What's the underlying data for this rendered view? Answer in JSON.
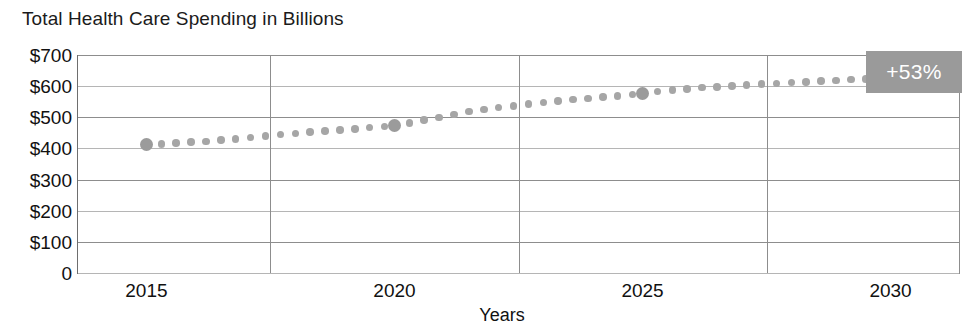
{
  "chart_data": {
    "type": "line",
    "title": "Total Health Care Spending in Billions",
    "xlabel": "Years",
    "ylabel": "",
    "xlim": [
      2013.6,
      2031.4
    ],
    "ylim": [
      0,
      700
    ],
    "grid": true,
    "legend": null,
    "marker_style": "dotted-line",
    "series_color": "#a6a6a6",
    "annotation": {
      "text": "+53%",
      "background": "#9a9a9a",
      "text_color": "#ffffff"
    },
    "y_ticks": [
      {
        "value": 700,
        "label": "$700"
      },
      {
        "value": 600,
        "label": "$600"
      },
      {
        "value": 500,
        "label": "$500"
      },
      {
        "value": 400,
        "label": "$400"
      },
      {
        "value": 300,
        "label": "$300"
      },
      {
        "value": 200,
        "label": "$200"
      },
      {
        "value": 100,
        "label": "$100"
      },
      {
        "value": 0,
        "label": "0"
      }
    ],
    "x_ticks": [
      {
        "value": 2015,
        "label": "2015"
      },
      {
        "value": 2020,
        "label": "2020"
      },
      {
        "value": 2025,
        "label": "2025"
      },
      {
        "value": 2030,
        "label": "2030"
      }
    ],
    "x": [
      2015.0,
      2015.3,
      2015.6,
      2015.9,
      2016.2,
      2016.5,
      2016.8,
      2017.1,
      2017.4,
      2017.7,
      2018.0,
      2018.3,
      2018.6,
      2018.9,
      2019.2,
      2019.5,
      2019.8,
      2020.0,
      2020.3,
      2020.6,
      2020.9,
      2021.2,
      2021.5,
      2021.8,
      2022.1,
      2022.4,
      2022.7,
      2023.0,
      2023.3,
      2023.6,
      2023.9,
      2024.2,
      2024.5,
      2024.8,
      2025.0,
      2025.3,
      2025.6,
      2025.9,
      2026.2,
      2026.5,
      2026.8,
      2027.1,
      2027.4,
      2027.7,
      2028.0,
      2028.3,
      2028.6,
      2028.9,
      2029.2,
      2029.5,
      2029.8,
      2030.0
    ],
    "values": [
      412,
      414,
      417,
      420,
      423,
      427,
      431,
      435,
      440,
      444,
      448,
      452,
      456,
      459,
      463,
      467,
      471,
      474,
      482,
      491,
      500,
      509,
      518,
      525,
      531,
      537,
      542,
      547,
      552,
      557,
      561,
      565,
      569,
      573,
      576,
      582,
      587,
      591,
      595,
      598,
      601,
      604,
      607,
      609,
      611,
      614,
      616,
      618,
      621,
      623,
      626,
      629
    ],
    "major_points": [
      {
        "x": 2015,
        "y": 412
      },
      {
        "x": 2020,
        "y": 474
      },
      {
        "x": 2025,
        "y": 576
      },
      {
        "x": 2030,
        "y": 629
      }
    ]
  }
}
